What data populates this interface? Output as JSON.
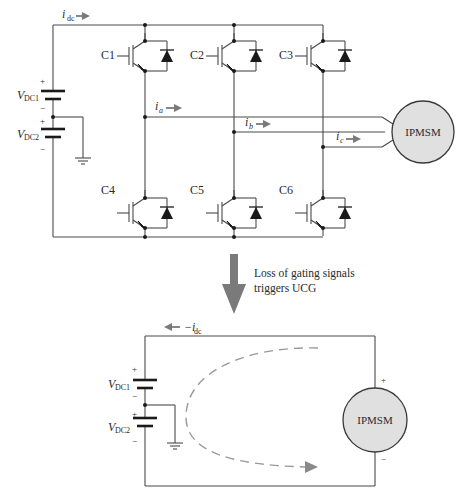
{
  "top_circuit": {
    "dc_current": {
      "symbol": "i",
      "subscript": "dc"
    },
    "sources": [
      {
        "symbol": "V",
        "subscript": "DC1",
        "plus": "+",
        "minus": "−"
      },
      {
        "symbol": "V",
        "subscript": "DC2",
        "plus": "+",
        "minus": "−"
      }
    ],
    "switches": [
      "C1",
      "C2",
      "C3",
      "C4",
      "C5",
      "C6"
    ],
    "phase_currents": [
      {
        "symbol": "i",
        "subscript": "a"
      },
      {
        "symbol": "i",
        "subscript": "b"
      },
      {
        "symbol": "i",
        "subscript": "c"
      }
    ],
    "motor": {
      "label": "IPMSM"
    }
  },
  "transition": {
    "line1": "Loss of gating signals",
    "line2": "triggers UCG"
  },
  "bottom_circuit": {
    "dc_current": {
      "prefix": "−i",
      "subscript": "dc"
    },
    "sources": [
      {
        "symbol": "V",
        "subscript": "DC1",
        "plus": "+",
        "minus": "−"
      },
      {
        "symbol": "V",
        "subscript": "DC2",
        "plus": "+",
        "minus": "−"
      }
    ],
    "motor": {
      "label": "IPMSM",
      "plus": "+",
      "minus": "−"
    }
  },
  "colors": {
    "wire": "#4a4a4a",
    "arrow_gray": "#7a7a7a",
    "motor_fill": "#e0e0e0",
    "dashed_path": "#999999"
  }
}
